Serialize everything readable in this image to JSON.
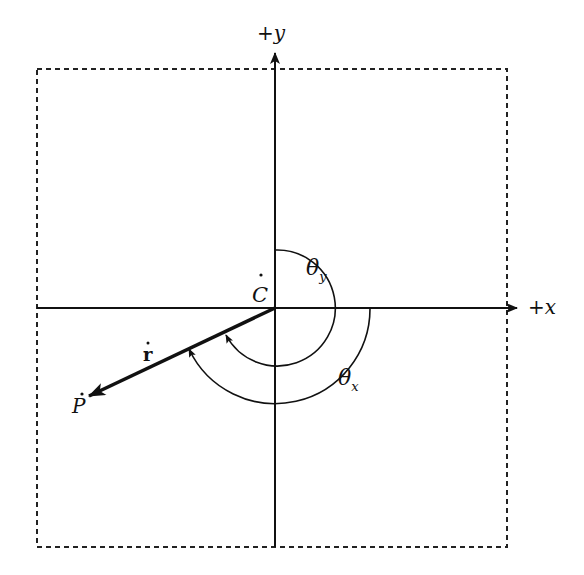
{
  "diagram": {
    "title": "",
    "colors": {
      "ink": "#111111",
      "background": "#ffffff"
    },
    "frame": {
      "style": "dashed",
      "left": 37,
      "top": 69,
      "right": 507,
      "bottom": 547
    },
    "origin": {
      "label": "C",
      "has_dot": true,
      "x": 275,
      "y": 308
    },
    "axes": {
      "x": {
        "label_sign": "+",
        "label_var": "x",
        "arrow_tip": [
          518,
          308
        ]
      },
      "y": {
        "label_sign": "+",
        "label_var": "y",
        "arrow_tip": [
          275,
          52
        ]
      }
    },
    "vector": {
      "label": "r",
      "has_dot": true,
      "bold": true,
      "from": "C",
      "to": "P",
      "end": [
        87,
        397
      ]
    },
    "point": {
      "label": "P",
      "has_dot": true
    },
    "angles": [
      {
        "symbol": "θ",
        "subscript": "y",
        "from_axis": "+y",
        "to": "r",
        "radius": 58,
        "direction": "clockwise"
      },
      {
        "symbol": "θ",
        "subscript": "x",
        "from_axis": "+x",
        "to": "r",
        "radius": 95,
        "direction": "clockwise"
      }
    ]
  }
}
